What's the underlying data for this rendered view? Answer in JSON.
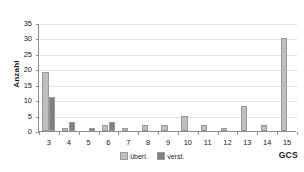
{
  "chart_data": {
    "type": "bar",
    "title": "",
    "subtitle": "",
    "xlabel": "GCS",
    "ylabel": "Anzahl",
    "categories": [
      "3",
      "4",
      "5",
      "6",
      "7",
      "8",
      "9",
      "10",
      "11",
      "12",
      "13",
      "14",
      "15"
    ],
    "series": [
      {
        "name": "überl.",
        "color": "#BFBFBF",
        "values": [
          19,
          1,
          0,
          2,
          1,
          2,
          2,
          5,
          2,
          1,
          8,
          2,
          30
        ]
      },
      {
        "name": "verst.",
        "color": "#808080",
        "values": [
          11,
          3,
          1,
          3,
          0,
          0,
          0,
          0,
          0,
          0,
          0,
          0,
          0
        ]
      }
    ],
    "ylim": [
      0,
      35
    ],
    "yticks": [
      0,
      5,
      10,
      15,
      20,
      25,
      30,
      35
    ],
    "ytick_labels": [
      "0",
      "5",
      "10",
      "15",
      "20",
      "25",
      "30",
      "35"
    ],
    "grid": true,
    "grid_axis": "y",
    "legend_position": "bottom-center",
    "axis_color": "#8C8C8C",
    "gridline_color": "#E2E2E2",
    "background": "#FFFFFF"
  },
  "legend": {
    "entries": [
      {
        "label": "überl.",
        "color": "#BFBFBF"
      },
      {
        "label": "verst.",
        "color": "#808080"
      }
    ]
  }
}
